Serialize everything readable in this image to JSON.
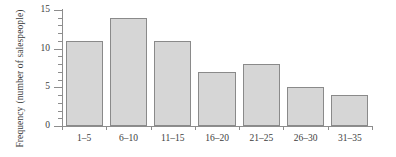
{
  "chart_data": {
    "type": "bar",
    "title": "",
    "subtitle": "",
    "xlabel": "",
    "ylabel_line1": "Frequency",
    "ylabel_line2": "(number of salespeople)",
    "categories": [
      "1–5",
      "6–10",
      "11–15",
      "16–20",
      "21–25",
      "26–30",
      "31–35"
    ],
    "values": [
      11,
      14,
      11,
      7,
      8,
      5,
      4
    ],
    "ylim": [
      0,
      15
    ],
    "y_major_ticks": [
      0,
      5,
      10,
      15
    ],
    "y_major_tick_labels": [
      "0",
      "5",
      "10",
      "15"
    ],
    "y_minor_tick_interval": 1,
    "grid": false,
    "legend": null,
    "bar_fill_color": "#d6d6d6",
    "bar_border_color": "#8a8a8a",
    "axis_color": "#8d8d8d",
    "text_color": "#3d3d3d",
    "background_color": "#ffffff"
  }
}
